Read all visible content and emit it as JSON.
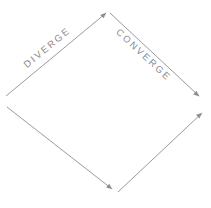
{
  "diagram": {
    "background_color": "#ffffff",
    "line_color": "#9b9b9b",
    "arrow_color": "#8f8f8f",
    "label_color": "#8c8c8c",
    "labels": {
      "diverge": "DIVERGE",
      "converge": "CONVERGE"
    },
    "edges": [
      {
        "name": "upper-left-edge",
        "label": "DIVERGE",
        "direction": "up-right",
        "from": [
          6,
          96
        ],
        "to": [
          106,
          13
        ],
        "arrowhead_at": "to"
      },
      {
        "name": "upper-right-edge",
        "label": "CONVERGE",
        "direction": "down-right",
        "from": [
          110,
          13
        ],
        "to": [
          199,
          96
        ],
        "arrowhead_at": "to"
      },
      {
        "name": "lower-left-edge",
        "label": "",
        "direction": "down-right",
        "from": [
          7,
          107
        ],
        "to": [
          112,
          189
        ],
        "arrowhead_at": "to"
      },
      {
        "name": "lower-right-edge",
        "label": "",
        "direction": "up-right",
        "from": [
          118,
          192
        ],
        "to": [
          202,
          113
        ],
        "arrowhead_at": "to"
      }
    ],
    "vertices": [
      {
        "name": "top-vertex",
        "position": [
          108,
          13
        ]
      },
      {
        "name": "right-vertex",
        "position": [
          200,
          104
        ]
      },
      {
        "name": "bottom-vertex",
        "position": [
          115,
          190
        ]
      },
      {
        "name": "left-vertex",
        "position": [
          6,
          101
        ]
      }
    ]
  }
}
